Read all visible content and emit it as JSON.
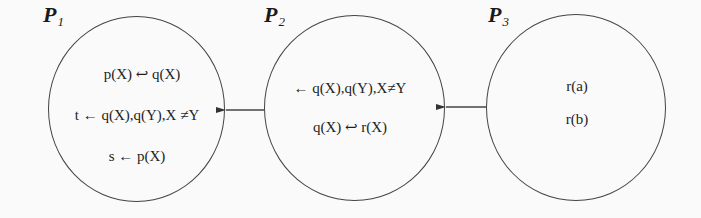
{
  "diagram": {
    "type": "program-flow-diagram",
    "stroke_color": "#444444",
    "text_color": "#1e1e1e",
    "nodes": [
      {
        "id": "P1",
        "label_main": "P",
        "label_sub": "1",
        "rules": [
          "p(X) ↩ q(X)",
          "t ← q(X),q(Y),X ≠Y",
          "s ← p(X)"
        ]
      },
      {
        "id": "P2",
        "label_main": "P",
        "label_sub": "2",
        "rules": [
          "← q(X),q(Y),X≠Y",
          "q(X) ↩ r(X)"
        ]
      },
      {
        "id": "P3",
        "label_main": "P",
        "label_sub": "3",
        "rules": [
          "r(a)",
          "r(b)"
        ]
      }
    ],
    "edges": [
      {
        "from": "P2",
        "to": "P1",
        "arrow": "left"
      },
      {
        "from": "P3",
        "to": "P2",
        "arrow": "left"
      }
    ]
  }
}
